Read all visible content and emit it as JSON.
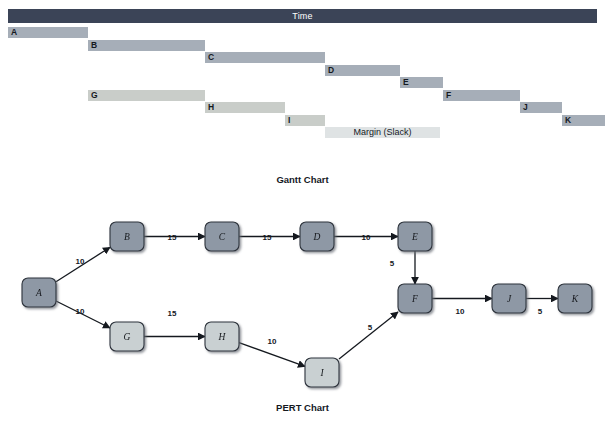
{
  "figure": {
    "gantt_caption": "Gantt Chart",
    "pert_caption": "PERT Chart"
  },
  "gantt": {
    "time_header_label": "Time",
    "slack_label": "Margin (Slack)",
    "colors": {
      "header": "#3b4457",
      "critical_bar": "#a6aeb8",
      "noncritical_bar": "#c9cdc9",
      "slack_bar": "#dfe3e4"
    },
    "tasks": [
      {
        "label": "A",
        "start": 8,
        "end": 88,
        "row": 0,
        "style": "dark"
      },
      {
        "label": "B",
        "start": 88,
        "end": 205,
        "row": 1,
        "style": "dark"
      },
      {
        "label": "C",
        "start": 205,
        "end": 325,
        "row": 2,
        "style": "dark"
      },
      {
        "label": "D",
        "start": 325,
        "end": 400,
        "row": 3,
        "style": "dark"
      },
      {
        "label": "E",
        "start": 400,
        "end": 443,
        "row": 4,
        "style": "dark"
      },
      {
        "label": "G",
        "start": 88,
        "end": 205,
        "row": 5,
        "style": "light"
      },
      {
        "label": "F",
        "start": 443,
        "end": 520,
        "row": 5,
        "style": "dark"
      },
      {
        "label": "H",
        "start": 205,
        "end": 285,
        "row": 6,
        "style": "light"
      },
      {
        "label": "J",
        "start": 520,
        "end": 562,
        "row": 6,
        "style": "dark"
      },
      {
        "label": "I",
        "start": 285,
        "end": 325,
        "row": 7,
        "style": "light"
      },
      {
        "label": "K",
        "start": 562,
        "end": 605,
        "row": 7,
        "style": "dark"
      }
    ],
    "slack": {
      "start": 325,
      "end": 440,
      "row": 8
    }
  },
  "pert": {
    "colors": {
      "critical_node": "#8e98a5",
      "noncritical_node": "#c9d0d2",
      "node_border": "#2d333c",
      "edge": "#15191f"
    },
    "nodes": [
      {
        "id": "A",
        "label": "A",
        "x": 22,
        "y": 82,
        "style": "critical"
      },
      {
        "id": "B",
        "label": "B",
        "x": 110,
        "y": 26,
        "style": "critical"
      },
      {
        "id": "C",
        "label": "C",
        "x": 205,
        "y": 26,
        "style": "critical"
      },
      {
        "id": "D",
        "label": "D",
        "x": 300,
        "y": 26,
        "style": "critical"
      },
      {
        "id": "E",
        "label": "E",
        "x": 398,
        "y": 26,
        "style": "critical"
      },
      {
        "id": "F",
        "label": "F",
        "x": 398,
        "y": 88,
        "style": "critical"
      },
      {
        "id": "J",
        "label": "J",
        "x": 492,
        "y": 88,
        "style": "critical"
      },
      {
        "id": "K",
        "label": "K",
        "x": 558,
        "y": 88,
        "style": "critical"
      },
      {
        "id": "G",
        "label": "G",
        "x": 110,
        "y": 126,
        "style": "noncritical"
      },
      {
        "id": "H",
        "label": "H",
        "x": 205,
        "y": 126,
        "style": "noncritical"
      },
      {
        "id": "I",
        "label": "I",
        "x": 305,
        "y": 162,
        "style": "noncritical"
      }
    ],
    "edges": [
      {
        "from": "A",
        "to": "B",
        "weight": "10",
        "lx": 80,
        "ly": 68
      },
      {
        "from": "B",
        "to": "C",
        "weight": "15",
        "lx": 172,
        "ly": 44
      },
      {
        "from": "C",
        "to": "D",
        "weight": "15",
        "lx": 267,
        "ly": 44
      },
      {
        "from": "D",
        "to": "E",
        "weight": "10",
        "lx": 366,
        "ly": 44
      },
      {
        "from": "E",
        "to": "F",
        "weight": "5",
        "lx": 392,
        "ly": 70
      },
      {
        "from": "A",
        "to": "G",
        "weight": "10",
        "lx": 80,
        "ly": 118
      },
      {
        "from": "G",
        "to": "H",
        "weight": "15",
        "lx": 172,
        "ly": 120
      },
      {
        "from": "H",
        "to": "I",
        "weight": "10",
        "lx": 272,
        "ly": 148
      },
      {
        "from": "I",
        "to": "F",
        "weight": "5",
        "lx": 370,
        "ly": 134
      },
      {
        "from": "F",
        "to": "J",
        "weight": "10",
        "lx": 460,
        "ly": 118
      },
      {
        "from": "J",
        "to": "K",
        "weight": "5",
        "lx": 540,
        "ly": 118
      }
    ]
  }
}
